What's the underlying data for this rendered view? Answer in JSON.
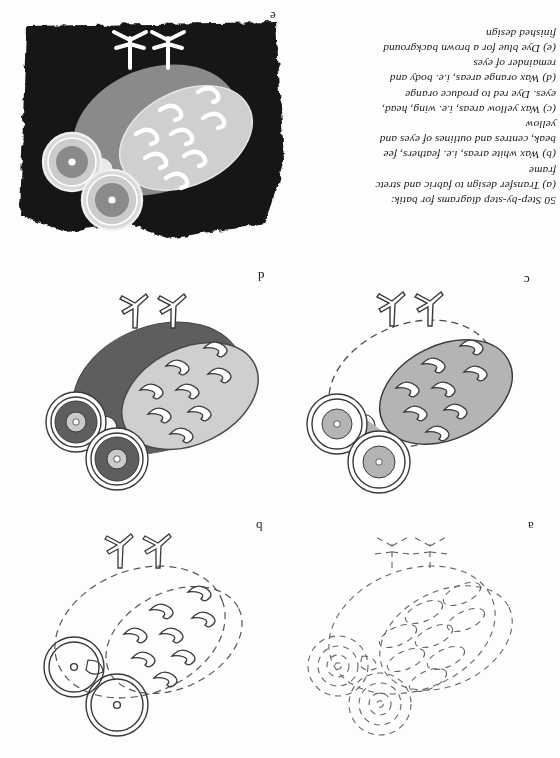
{
  "figure": {
    "caption_number": "50",
    "caption_title": "Step-by-step diagrams for batik:",
    "steps": [
      "(a)  Transfer design to fabric and stretch in a frame",
      "(b)  Wax white areas, i.e. feathers, feet, beak, centres and outlines of eyes and yellow",
      "(c)  Wax yellow areas, i.e. wing, head, inner eyes. Dye red to produce orange",
      "(d)  Wax orange areas, i.e. body and remainder of eyes",
      "(e)  Dye blue for a brown background and finished design"
    ],
    "caption_lines": [
      "50  Step-by-step diagrams for batik:",
      "(a)  Transfer design to fabric and stretc",
      "frame",
      "(b)  Wax white areas, i.e. feathers, fee",
      "beak, centres and outlines of eyes and",
      "yellow",
      "(c)  Wax yellow areas, i.e. wing, head,",
      "eyes. Dye red to produce orange",
      "(d)  Wax orange areas, i.e. body and",
      "remainder of eyes",
      "(e)  Dye blue for a brown background",
      "finished design"
    ]
  },
  "panels": [
    {
      "id": "a",
      "label": "a",
      "description": "Owl design transferred to fabric, all lines dashed outline only",
      "state": "outline-only"
    },
    {
      "id": "b",
      "label": "b",
      "description": "White areas waxed: feathers, feet, beak, eye centres and outlines",
      "state": "white-waxed"
    },
    {
      "id": "c",
      "label": "c",
      "description": "Yellow areas waxed: wing, head, inner eyes; dyed red to produce orange",
      "state": "yellow-waxed"
    },
    {
      "id": "d",
      "label": "d",
      "description": "Orange areas waxed: body and remainder of eyes",
      "state": "orange-waxed"
    },
    {
      "id": "e",
      "label": "e",
      "description": "Dyed blue for a brown background, finished design",
      "state": "finished"
    }
  ],
  "colors": {
    "background_dark": "#141414",
    "mid_gray": "#7c7c7c",
    "light_gray": "#c9c9c9",
    "pale_gray": "#b9b9b9",
    "ink": "#2b2b2b",
    "paper": "#fdfdfb"
  }
}
